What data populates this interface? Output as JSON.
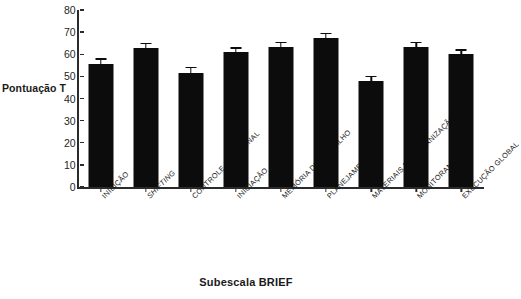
{
  "chart_data": {
    "type": "bar",
    "title": "",
    "xlabel": "Subescala BRIEF",
    "ylabel": "Pontuação T",
    "ylim": [
      0,
      80
    ],
    "ytick_step": 10,
    "yticks": [
      "80",
      "70",
      "60",
      "50",
      "40",
      "30",
      "20",
      "10",
      "0"
    ],
    "grid": false,
    "legend": "none",
    "bar_color": "#0c0c0c",
    "axis_color": "#2b2b2b",
    "categories": [
      "INIBIÇÃO",
      "SHIFTING",
      "CONTROLE EMOCIONAL",
      "INICIAÇÃO",
      "MEMÓRIA DE TRABALHO",
      "PLANEJAMENTO",
      "MATERIAIS DE ORGANIZAÇÃO",
      "MONITORAMENTO",
      "EXECUÇÃO GLOBAL"
    ],
    "categories_italic": [
      false,
      true,
      false,
      false,
      false,
      false,
      false,
      false,
      false
    ],
    "values": [
      55.8,
      62.8,
      51.5,
      61.2,
      63.5,
      67.3,
      47.8,
      63.3,
      60.2
    ],
    "errors": [
      1.8,
      1.8,
      2.2,
      1.3,
      1.5,
      1.8,
      1.8,
      1.7,
      1.5
    ]
  }
}
